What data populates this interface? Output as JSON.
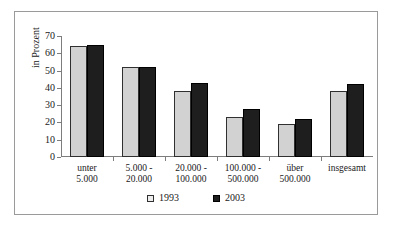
{
  "chart_data": {
    "type": "bar",
    "title": "",
    "xlabel": "",
    "ylabel": "in Prozent",
    "ylim": [
      0,
      70
    ],
    "yticks": [
      0,
      10,
      20,
      30,
      40,
      50,
      60,
      70
    ],
    "ytick_labels": [
      "0",
      "10",
      "20",
      "30",
      "40",
      "50",
      "60",
      "70"
    ],
    "grid": false,
    "legend_position": "bottom-center",
    "categories": [
      "unter 5.000",
      "5.000 - 20.000",
      "20.000 - 100.000",
      "100.000 - 500.000",
      "über 500.000",
      "insgesamt"
    ],
    "category_lines": [
      [
        "unter",
        "5.000"
      ],
      [
        "5.000 -",
        "20.000"
      ],
      [
        "20.000 -",
        "100.000"
      ],
      [
        "100.000 -",
        "500.000"
      ],
      [
        "über",
        "500.000"
      ],
      [
        "insgesamt",
        ""
      ]
    ],
    "series": [
      {
        "name": "1993",
        "color": "#d2d2d2",
        "values": [
          64,
          52,
          38,
          23,
          19,
          38
        ]
      },
      {
        "name": "2003",
        "color": "#1e1e1e",
        "values": [
          65,
          52,
          43,
          28,
          22,
          42
        ]
      }
    ]
  },
  "legend": {
    "items": [
      {
        "label": "1993"
      },
      {
        "label": "2003"
      }
    ]
  },
  "axis": {
    "y_title": "in Prozent"
  }
}
